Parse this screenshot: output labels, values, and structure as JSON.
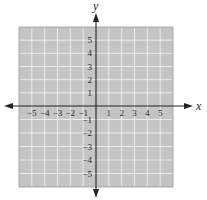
{
  "chart_data": {
    "type": "scatter",
    "title": "",
    "xlabel": "x",
    "ylabel": "y",
    "xlim": [
      -6,
      6
    ],
    "ylim": [
      -6,
      6
    ],
    "grid": true,
    "x_ticks": [
      -5,
      -4,
      -3,
      -2,
      -1,
      1,
      2,
      3,
      4,
      5
    ],
    "y_ticks": [
      -5,
      -4,
      -3,
      -2,
      -1,
      1,
      2,
      3,
      4,
      5
    ],
    "x_tick_labels": [
      "−5",
      "−4",
      "−3",
      "−2",
      "−1",
      "1",
      "2",
      "3",
      "4",
      "5"
    ],
    "y_tick_labels": [
      "−5",
      "−4",
      "−3",
      "−2",
      "−1",
      "1",
      "2",
      "3",
      "4",
      "5"
    ],
    "series": [],
    "colors": {
      "grid_background": "#c4c4c4",
      "grid_lines": "#ececec",
      "axis": "#222222"
    }
  }
}
